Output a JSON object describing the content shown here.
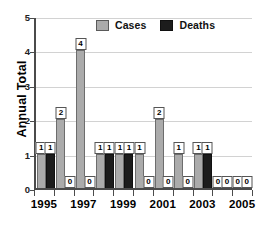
{
  "chart": {
    "ylabel": "Annual Total",
    "legend": [
      {
        "label": "Cases",
        "color": "#ababab",
        "icon": "legend-swatch-cases"
      },
      {
        "label": "Deaths",
        "color": "#1c1c1c",
        "icon": "legend-swatch-deaths"
      }
    ],
    "yticks": [
      "0",
      "1",
      "2",
      "3",
      "4",
      "5"
    ],
    "xticklabels": [
      "1995",
      "1997",
      "1999",
      "2001",
      "2003",
      "2005"
    ]
  },
  "chart_data": {
    "type": "bar",
    "title": "",
    "xlabel": "",
    "ylabel": "Annual Total",
    "ylim": [
      0,
      5
    ],
    "yticks": [
      0,
      1,
      2,
      3,
      4,
      5
    ],
    "grid": true,
    "legend_position": "top-center",
    "categories": [
      "1995",
      "1996",
      "1997",
      "1998",
      "1999",
      "2000",
      "2001",
      "2002",
      "2003",
      "2004",
      "2005"
    ],
    "xtick_labels_shown": [
      "1995",
      "1997",
      "1999",
      "2001",
      "2003",
      "2005"
    ],
    "series": [
      {
        "name": "Cases",
        "color": "#ababab",
        "values": [
          1,
          2,
          4,
          1,
          1,
          1,
          2,
          1,
          1,
          0,
          0
        ]
      },
      {
        "name": "Deaths",
        "color": "#1c1c1c",
        "values": [
          1,
          0,
          0,
          1,
          1,
          0,
          0,
          0,
          1,
          0,
          0
        ]
      }
    ],
    "data_labels": [
      {
        "category": "1995",
        "cases": "1",
        "deaths": "1"
      },
      {
        "category": "1996",
        "cases": "2",
        "deaths": "0"
      },
      {
        "category": "1997",
        "cases": "4",
        "deaths": "0"
      },
      {
        "category": "1998",
        "cases": "1",
        "deaths": "1"
      },
      {
        "category": "1999",
        "cases": "1",
        "deaths": "1"
      },
      {
        "category": "2000",
        "cases": "1",
        "deaths": "0"
      },
      {
        "category": "2001",
        "cases": "2",
        "deaths": "0"
      },
      {
        "category": "2002",
        "cases": "1",
        "deaths": "0"
      },
      {
        "category": "2003",
        "cases": "1",
        "deaths": "1"
      },
      {
        "category": "2004",
        "cases": "0",
        "deaths": "0"
      },
      {
        "category": "2005",
        "cases": "0",
        "deaths": "0"
      }
    ]
  }
}
